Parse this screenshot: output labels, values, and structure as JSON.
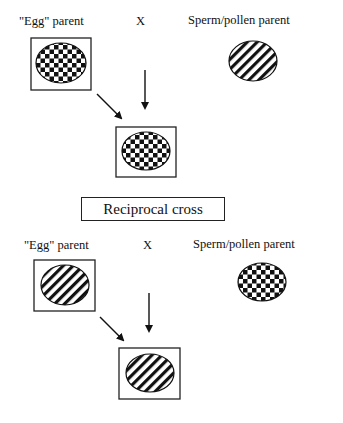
{
  "labels": {
    "egg_parent": "\"Egg\" parent",
    "cross_symbol": "X",
    "sperm_parent": "Sperm/pollen parent"
  },
  "separator": {
    "text": "Reciprocal cross"
  },
  "crosses": [
    {
      "name": "original-cross",
      "egg_parent_pattern": "checkered",
      "sperm_parent_pattern": "striped",
      "offspring_pattern": "checkered",
      "egg_parent_boxed": true,
      "offspring_boxed": true
    },
    {
      "name": "reciprocal-cross",
      "egg_parent_pattern": "striped",
      "sperm_parent_pattern": "checkered",
      "offspring_pattern": "striped",
      "egg_parent_boxed": true,
      "offspring_boxed": true
    }
  ],
  "colors": {
    "ink": "#111111",
    "background": "#ffffff"
  }
}
